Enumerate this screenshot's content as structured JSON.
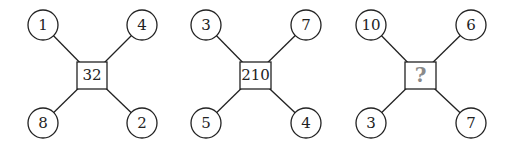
{
  "puzzle": {
    "figures": [
      {
        "top_left": "1",
        "top_right": "4",
        "bottom_left": "8",
        "bottom_right": "2",
        "center": "32"
      },
      {
        "top_left": "3",
        "top_right": "7",
        "bottom_left": "5",
        "bottom_right": "4",
        "center": "210"
      },
      {
        "top_left": "10",
        "top_right": "6",
        "bottom_left": "3",
        "bottom_right": "7",
        "center": "?"
      }
    ],
    "colors": {
      "stroke": "#222222",
      "question_mark": "#8a8a8a",
      "background": "#ffffff"
    }
  }
}
